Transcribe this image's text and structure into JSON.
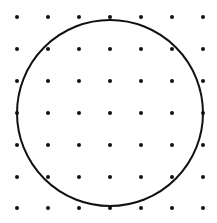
{
  "diagram": {
    "type": "dot-grid-with-circle",
    "background": "#ffffff",
    "ink": "#111111",
    "grid": {
      "rows": 7,
      "cols": 7,
      "xs": [
        17,
        48,
        79,
        110,
        141,
        172,
        203
      ],
      "ys": [
        17,
        49,
        81,
        113,
        145,
        177,
        208
      ],
      "dot_radius": 2
    },
    "circle": {
      "cx": 110,
      "cy": 113,
      "r": 93,
      "stroke_width": 2
    }
  }
}
